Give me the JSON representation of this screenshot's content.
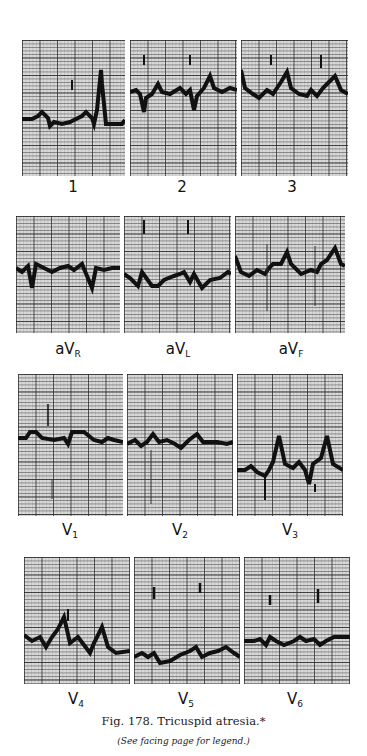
{
  "figure": {
    "number": "Fig. 178.",
    "title": "Tricuspid atresia.*",
    "caption": "Fig. 178. Tricuspid atresia.*",
    "note": "(See facing page for legend.)"
  },
  "rows": [
    {
      "name": "limb-leads",
      "leads": [
        {
          "id": "lead-1",
          "label": "1",
          "sub": ""
        },
        {
          "id": "lead-2",
          "label": "2",
          "sub": ""
        },
        {
          "id": "lead-3",
          "label": "3",
          "sub": ""
        }
      ]
    },
    {
      "name": "augmented-leads",
      "leads": [
        {
          "id": "lead-avr",
          "label": "aV",
          "sub": "R"
        },
        {
          "id": "lead-avl",
          "label": "aV",
          "sub": "L"
        },
        {
          "id": "lead-avf",
          "label": "aV",
          "sub": "F"
        }
      ]
    },
    {
      "name": "precordial-leads-1",
      "leads": [
        {
          "id": "lead-v1",
          "label": "V",
          "sub": "1"
        },
        {
          "id": "lead-v2",
          "label": "V",
          "sub": "2"
        },
        {
          "id": "lead-v3",
          "label": "V",
          "sub": "3"
        }
      ]
    },
    {
      "name": "precordial-leads-2",
      "leads": [
        {
          "id": "lead-v4",
          "label": "V",
          "sub": "4"
        },
        {
          "id": "lead-v5",
          "label": "V",
          "sub": "5"
        },
        {
          "id": "lead-v6",
          "label": "V",
          "sub": "6"
        }
      ]
    }
  ],
  "colors": {
    "grid_paper": "#d9d9d9",
    "trace": "#111111",
    "page": "#ffffff"
  }
}
